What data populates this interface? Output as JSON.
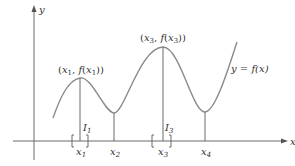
{
  "diagram": {
    "type": "function-graph-local-extrema",
    "axes": {
      "x_label": "x",
      "y_label": "y"
    },
    "curve_label": "y = f(x)",
    "points": [
      {
        "name": "x1",
        "label_var": "x",
        "label_sub": "1",
        "kind": "local-max",
        "annotation": "(x1, f(x1))"
      },
      {
        "name": "x2",
        "label_var": "x",
        "label_sub": "2",
        "kind": "local-min"
      },
      {
        "name": "x3",
        "label_var": "x",
        "label_sub": "3",
        "kind": "local-max",
        "annotation": "(x3, f(x3))"
      },
      {
        "name": "x4",
        "label_var": "x",
        "label_sub": "4",
        "kind": "local-min"
      }
    ],
    "intervals": [
      {
        "name": "I1",
        "label_var": "I",
        "label_sub": "1",
        "around": "x1"
      },
      {
        "name": "I3",
        "label_var": "I",
        "label_sub": "3",
        "around": "x3"
      }
    ],
    "colors": {
      "axis": "#6b6b6b",
      "curve": "#8a8a8a",
      "text": "#333333"
    }
  },
  "labels": {
    "x_axis": "x",
    "y_axis": "y",
    "curve": "y = f(x)",
    "p1_open": "(",
    "p1_var": "x",
    "p1_sub": "1",
    "p1_mid": ", f(",
    "p1_var2": "x",
    "p1_sub2": "1",
    "p1_close": "))",
    "p3_open": "(",
    "p3_var": "x",
    "p3_sub": "3",
    "p3_mid": ", f(",
    "p3_var2": "x",
    "p3_sub2": "3",
    "p3_close": "))",
    "x1_var": "x",
    "x1_sub": "1",
    "x2_var": "x",
    "x2_sub": "2",
    "x3_var": "x",
    "x3_sub": "3",
    "x4_var": "x",
    "x4_sub": "4",
    "i1_var": "I",
    "i1_sub": "1",
    "i3_var": "I",
    "i3_sub": "3"
  }
}
